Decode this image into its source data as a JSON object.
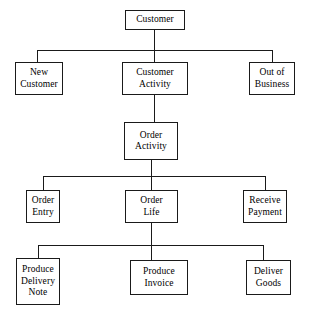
{
  "diagram": {
    "type": "tree",
    "background_color": "#ffffff",
    "line_color": "#1a1a1a",
    "text_color": "#000000",
    "levels": 4,
    "nodes": [
      {
        "id": "customer",
        "label": "Customer",
        "level": 1,
        "x": 125,
        "y": 10,
        "w": 60,
        "h": 20
      },
      {
        "id": "new_customer",
        "label": "New\nCustomer",
        "level": 2,
        "x": 15,
        "y": 62,
        "w": 48,
        "h": 33
      },
      {
        "id": "customer_activity",
        "label": "Customer\nActivity",
        "level": 2,
        "x": 122,
        "y": 62,
        "w": 66,
        "h": 33
      },
      {
        "id": "out_of_business",
        "label": "Out of\nBusiness",
        "level": 2,
        "x": 249,
        "y": 62,
        "w": 46,
        "h": 33
      },
      {
        "id": "order_activity",
        "label": "Order\nActivity",
        "level": 3,
        "x": 124,
        "y": 122,
        "w": 54,
        "h": 38
      },
      {
        "id": "order_entry",
        "label": "Order\nEntry",
        "level": 4,
        "x": 26,
        "y": 190,
        "w": 34,
        "h": 33
      },
      {
        "id": "order_life",
        "label": "Order\nLife",
        "level": 4,
        "x": 125,
        "y": 190,
        "w": 53,
        "h": 33
      },
      {
        "id": "receive_payment",
        "label": "Receive\nPayment",
        "level": 4,
        "x": 243,
        "y": 190,
        "w": 44,
        "h": 33
      },
      {
        "id": "produce_delivery_note",
        "label": "Produce\nDelivery\nNote",
        "level": 5,
        "x": 16,
        "y": 258,
        "w": 44,
        "h": 47
      },
      {
        "id": "produce_invoice",
        "label": "Produce\nInvoice",
        "level": 5,
        "x": 130,
        "y": 260,
        "w": 58,
        "h": 35
      },
      {
        "id": "deliver_goods",
        "label": "Deliver\nGoods",
        "level": 5,
        "x": 246,
        "y": 260,
        "w": 45,
        "h": 35
      }
    ],
    "edges": [
      {
        "from": "customer",
        "to": "new_customer"
      },
      {
        "from": "customer",
        "to": "customer_activity"
      },
      {
        "from": "customer",
        "to": "out_of_business"
      },
      {
        "from": "customer_activity",
        "to": "order_activity"
      },
      {
        "from": "order_activity",
        "to": "order_entry"
      },
      {
        "from": "order_activity",
        "to": "order_life"
      },
      {
        "from": "order_activity",
        "to": "receive_payment"
      },
      {
        "from": "order_life",
        "to": "produce_delivery_note"
      },
      {
        "from": "order_life",
        "to": "produce_invoice"
      },
      {
        "from": "order_life",
        "to": "deliver_goods"
      }
    ],
    "connectors": [
      {
        "id": "c1-stem",
        "orient": "v",
        "x": 154,
        "y": 30,
        "len": 20
      },
      {
        "id": "c1-bus",
        "orient": "h",
        "x": 37,
        "y": 50,
        "len": 236
      },
      {
        "id": "c1-leg-left",
        "orient": "v",
        "x": 37,
        "y": 50,
        "len": 12
      },
      {
        "id": "c1-leg-mid",
        "orient": "v",
        "x": 154,
        "y": 50,
        "len": 12
      },
      {
        "id": "c1-leg-right",
        "orient": "v",
        "x": 272,
        "y": 50,
        "len": 12
      },
      {
        "id": "c2-stem",
        "orient": "v",
        "x": 154,
        "y": 95,
        "len": 27
      },
      {
        "id": "c3-stem",
        "orient": "v",
        "x": 151,
        "y": 160,
        "len": 16
      },
      {
        "id": "c3-bus",
        "orient": "h",
        "x": 43,
        "y": 176,
        "len": 222
      },
      {
        "id": "c3-leg-left",
        "orient": "v",
        "x": 43,
        "y": 176,
        "len": 14
      },
      {
        "id": "c3-leg-mid",
        "orient": "v",
        "x": 151,
        "y": 176,
        "len": 14
      },
      {
        "id": "c3-leg-right",
        "orient": "v",
        "x": 265,
        "y": 176,
        "len": 14
      },
      {
        "id": "c4-stem",
        "orient": "v",
        "x": 151,
        "y": 223,
        "len": 22
      },
      {
        "id": "c4-bus",
        "orient": "h",
        "x": 38,
        "y": 245,
        "len": 225
      },
      {
        "id": "c4-leg-left",
        "orient": "v",
        "x": 38,
        "y": 245,
        "len": 13
      },
      {
        "id": "c4-leg-mid",
        "orient": "v",
        "x": 151,
        "y": 245,
        "len": 15
      },
      {
        "id": "c4-leg-right",
        "orient": "v",
        "x": 263,
        "y": 245,
        "len": 15
      }
    ]
  }
}
